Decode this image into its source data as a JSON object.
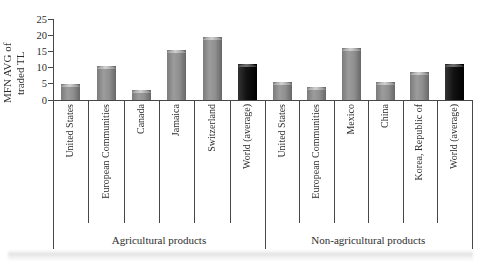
{
  "chart_data": {
    "type": "bar",
    "title": "",
    "ylabel_lines": [
      "MFN AVG of",
      "traded TL"
    ],
    "ylim": [
      0,
      25
    ],
    "yticks": [
      0,
      5,
      10,
      15,
      20,
      25
    ],
    "grid": false,
    "legend": "none",
    "groups": [
      {
        "label": "Agricultural products",
        "bars": [
          {
            "category": "United States",
            "value": 5,
            "color": "gray"
          },
          {
            "category": "European Communities",
            "value": 10.5,
            "color": "gray"
          },
          {
            "category": "Canada",
            "value": 3,
            "color": "gray"
          },
          {
            "category": "Jamaica",
            "value": 15.5,
            "color": "gray"
          },
          {
            "category": "Switzerland",
            "value": 19.5,
            "color": "gray"
          },
          {
            "category": "World (average)",
            "value": 11,
            "color": "black"
          }
        ]
      },
      {
        "label": "Non-agricultural products",
        "bars": [
          {
            "category": "United States",
            "value": 5.5,
            "color": "gray"
          },
          {
            "category": "European Communities",
            "value": 4,
            "color": "gray"
          },
          {
            "category": "Mexico",
            "value": 16,
            "color": "gray"
          },
          {
            "category": "China",
            "value": 5.5,
            "color": "gray"
          },
          {
            "category": "Korea, Republic of",
            "value": 8.5,
            "color": "gray"
          },
          {
            "category": "World (average)",
            "value": 11,
            "color": "black"
          }
        ]
      }
    ],
    "colors": {
      "bar_gray": "#8d8d8d",
      "bar_gray_highlight": "#c8c8c8",
      "bar_black": "#111111",
      "axis_line": "#474747",
      "text": "#2d2d2d",
      "background": "#ffffff"
    }
  }
}
